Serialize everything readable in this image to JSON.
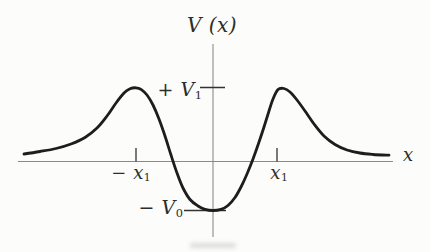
{
  "figure": {
    "title_label": {
      "text": "V (x)"
    },
    "axis_x_label": {
      "text": "x"
    },
    "y_tick_labels": {
      "v1": {
        "text": "+ V",
        "sub": "1"
      },
      "v0": {
        "text": "− V",
        "sub": "0"
      }
    },
    "x_tick_labels": {
      "neg_x1": {
        "text": "− x",
        "sub": "1"
      },
      "pos_x1": {
        "text": "x",
        "sub": "1"
      }
    }
  },
  "colors": {
    "paper": "#fcfcfa",
    "curve_ink": "#1d1d1d",
    "axis_gray": "#8a8a8a",
    "tick_ink": "#333333",
    "label_ink": "#2c2c2c"
  },
  "chart_data": {
    "type": "line",
    "title": "V (x)",
    "xlabel": "x",
    "ylabel": "V (x)",
    "x_ticks": [
      "−x₁",
      "x₁"
    ],
    "y_ticks": [
      "+V₁",
      "−V₀"
    ],
    "grid": false,
    "legend": false,
    "key_points": [
      {
        "x": "−x₁",
        "V": "+V₁",
        "feature": "left barrier maximum"
      },
      {
        "x": "0",
        "V": "−V₀",
        "feature": "well minimum"
      },
      {
        "x": "+x₁",
        "V": "+V₁",
        "feature": "right barrier maximum"
      },
      {
        "x": "±∞",
        "V": "0",
        "feature": "asymptotic value"
      }
    ],
    "approx_V1_to_V0_ratio": 1.5,
    "curve_trace_px": [
      [
        24,
        154
      ],
      [
        40,
        151.5
      ],
      [
        56,
        148.5
      ],
      [
        71,
        144
      ],
      [
        85,
        137.5
      ],
      [
        97,
        128
      ],
      [
        107,
        116
      ],
      [
        116,
        103
      ],
      [
        124,
        93
      ],
      [
        130,
        88.8
      ],
      [
        136,
        87.8
      ],
      [
        141,
        89.3
      ],
      [
        147,
        95
      ],
      [
        153,
        105
      ],
      [
        159,
        119
      ],
      [
        165,
        136
      ],
      [
        171,
        155
      ],
      [
        177,
        173
      ],
      [
        183,
        188
      ],
      [
        190,
        199.5
      ],
      [
        198,
        206
      ],
      [
        205,
        209.3
      ],
      [
        213,
        210.5
      ],
      [
        221,
        209.3
      ],
      [
        228,
        205.5
      ],
      [
        235,
        197.5
      ],
      [
        241,
        187
      ],
      [
        247,
        174
      ],
      [
        253,
        159
      ],
      [
        258,
        145
      ],
      [
        264,
        127
      ],
      [
        269,
        111
      ],
      [
        273,
        99
      ],
      [
        278,
        89.5
      ],
      [
        284,
        88.5
      ],
      [
        290,
        92
      ],
      [
        297,
        100
      ],
      [
        305,
        111
      ],
      [
        314,
        124
      ],
      [
        324,
        136
      ],
      [
        335,
        144.5
      ],
      [
        347,
        150
      ],
      [
        360,
        153
      ],
      [
        373,
        154.5
      ],
      [
        389,
        155.2
      ]
    ],
    "axes_px": {
      "y_axis": {
        "x": 213,
        "y1": 44,
        "y2": 237
      },
      "x_axis": {
        "y": 161.5,
        "x1": 18,
        "x2": 393
      },
      "v1_tick_y": 87.5,
      "v0_tick_y": 210.5,
      "neg_x1_tick_x": 136,
      "pos_x1_tick_x": 277
    }
  }
}
